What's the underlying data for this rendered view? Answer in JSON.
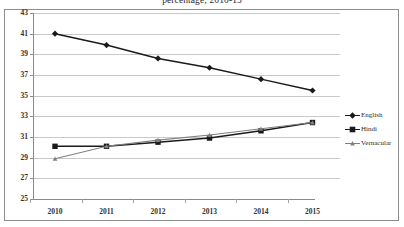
{
  "chart": {
    "title": "percentage; 2010-15",
    "plot_bg": "#ffffff",
    "grid_color": "#c9c9c9",
    "axis_color": "#8a8a8a",
    "frame_color": "#8d8d8d"
  },
  "legend": {
    "position": "right",
    "items": [
      {
        "label": "English",
        "marker": "diamond",
        "color": "#1a1a1a"
      },
      {
        "label": "Hindi",
        "marker": "square",
        "color": "#1a1a1a"
      },
      {
        "label": "Vernacular",
        "marker": "triangle",
        "color": "#808080"
      }
    ]
  },
  "axes": {
    "y_ticks": [
      "43",
      "41",
      "39",
      "37",
      "35",
      "33",
      "31",
      "29",
      "27",
      "25"
    ],
    "x_ticks": [
      "2010",
      "2011",
      "2012",
      "2013",
      "2014",
      "2015"
    ]
  },
  "chart_data": {
    "type": "line",
    "title": "percentage; 2010-15",
    "xlabel": "",
    "ylabel": "",
    "categories": [
      "2010",
      "2011",
      "2012",
      "2013",
      "2014",
      "2015"
    ],
    "x": [
      2010,
      2011,
      2012,
      2013,
      2014,
      2015
    ],
    "ylim": [
      25,
      43
    ],
    "y_tick_step": 2,
    "grid": "horizontal",
    "legend_position": "right",
    "series": [
      {
        "name": "English",
        "marker": "diamond",
        "color": "#1a1a1a",
        "values": [
          41.0,
          39.9,
          38.6,
          37.7,
          36.6,
          35.5
        ]
      },
      {
        "name": "Hindi",
        "marker": "square",
        "color": "#1a1a1a",
        "values": [
          30.1,
          30.1,
          30.5,
          30.9,
          31.6,
          32.4
        ]
      },
      {
        "name": "Vernacular",
        "marker": "triangle",
        "color": "#808080",
        "values": [
          28.9,
          30.1,
          30.7,
          31.2,
          31.8,
          32.4
        ]
      }
    ]
  }
}
